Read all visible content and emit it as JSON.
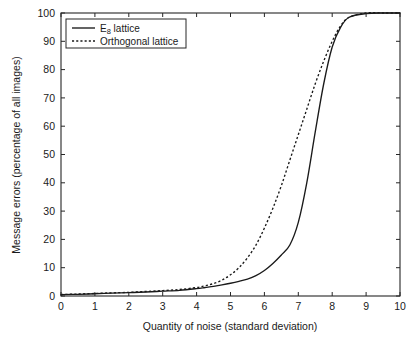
{
  "chart_data": {
    "type": "line",
    "title": "",
    "xlabel": "Quantity of noise (standard deviation)",
    "ylabel": "Message errors (percentage of all images)",
    "xlim": [
      0,
      10
    ],
    "ylim": [
      0,
      100
    ],
    "xticks": [
      "0",
      "1",
      "2",
      "3",
      "4",
      "5",
      "6",
      "7",
      "8",
      "9",
      "10"
    ],
    "yticks": [
      "0",
      "10",
      "20",
      "30",
      "40",
      "50",
      "60",
      "70",
      "80",
      "90",
      "100"
    ],
    "grid": false,
    "legend_position": "top-left",
    "series": [
      {
        "name": "E8 lattice",
        "label_main": "E",
        "label_sub": "8",
        "label_tail": " lattice",
        "style": "solid",
        "color": "#1a1a1a",
        "x": [
          0.0,
          0.5,
          1.0,
          1.5,
          2.0,
          2.5,
          3.0,
          3.5,
          4.0,
          4.25,
          4.5,
          4.75,
          5.0,
          5.25,
          5.5,
          5.75,
          6.0,
          6.25,
          6.5,
          6.75,
          7.0,
          7.25,
          7.5,
          7.75,
          8.0,
          8.25,
          8.5,
          9.0,
          9.5,
          10.0
        ],
        "y": [
          0.5,
          0.6,
          0.8,
          1.0,
          1.2,
          1.4,
          1.7,
          2.0,
          2.6,
          3.0,
          3.4,
          3.9,
          4.5,
          5.2,
          6.0,
          7.2,
          9.0,
          11.5,
          14.5,
          18.0,
          26.0,
          40.0,
          58.0,
          75.0,
          88.0,
          95.0,
          98.5,
          99.8,
          100.0,
          100.0
        ]
      },
      {
        "name": "Orthogonal lattice",
        "label_main": "Orthogonal lattice",
        "style": "dotted",
        "color": "#1a1a1a",
        "x": [
          0.0,
          0.5,
          1.0,
          1.5,
          2.0,
          2.5,
          3.0,
          3.5,
          4.0,
          4.25,
          4.5,
          4.75,
          5.0,
          5.25,
          5.5,
          5.75,
          6.0,
          6.25,
          6.5,
          6.75,
          7.0,
          7.25,
          7.5,
          7.75,
          8.0,
          8.25,
          8.5,
          9.0,
          9.5,
          10.0
        ],
        "y": [
          0.5,
          0.7,
          0.9,
          1.1,
          1.3,
          1.6,
          1.9,
          2.3,
          3.0,
          3.6,
          4.4,
          5.6,
          7.5,
          10.0,
          13.5,
          18.0,
          24.0,
          31.0,
          39.0,
          48.0,
          57.0,
          66.0,
          75.0,
          83.0,
          90.0,
          95.5,
          98.5,
          100.0,
          100.0,
          100.0
        ]
      }
    ]
  },
  "legend": {
    "items": [
      {
        "label": "E8 lattice"
      },
      {
        "label": "Orthogonal lattice"
      }
    ]
  }
}
